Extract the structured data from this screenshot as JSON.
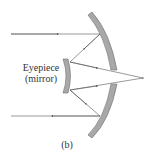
{
  "diagram": {
    "type": "ray-optics",
    "labels": {
      "eyepiece": "Eyepiece",
      "eyepiece_note": "(mirror)",
      "figure": "(b)"
    },
    "colors": {
      "mirror_fill": "#a8a8a8",
      "mirror_edge": "#6e6e6e",
      "ray": "#555555",
      "text": "#333333"
    },
    "primary_mirror": {
      "top": [
        90,
        14
      ],
      "bottom": [
        90,
        136
      ],
      "apex_x": 116,
      "central_hole": [
        70,
        84
      ]
    },
    "secondary_mirror": {
      "x": [
        62,
        70
      ],
      "y": [
        60,
        92
      ]
    },
    "focus_point": [
      143,
      78
    ],
    "incoming_rays_y": [
      34,
      116
    ]
  }
}
